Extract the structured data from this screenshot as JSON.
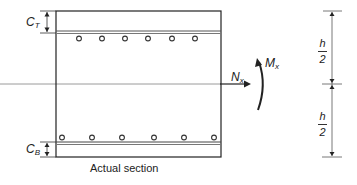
{
  "diagram": {
    "caption": "Actual section",
    "labels": {
      "cover_top": {
        "main": "C",
        "sub": "T"
      },
      "cover_bottom": {
        "main": "C",
        "sub": "B"
      },
      "axial_force": {
        "main": "N",
        "sub": "x"
      },
      "moment": {
        "main": "M",
        "sub": "x"
      },
      "half_depth_top": {
        "num": "h",
        "den": "2"
      },
      "half_depth_bottom": {
        "num": "h",
        "den": "2"
      }
    },
    "top_bars_count": 6,
    "bottom_bars_count": 6,
    "colors": {
      "line": "#222222",
      "axis": "#888888",
      "bar": "#333333"
    }
  }
}
